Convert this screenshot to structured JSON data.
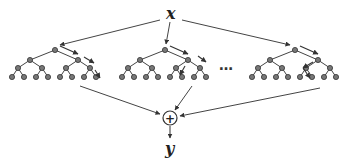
{
  "diagram": {
    "title": "",
    "input_label": "x",
    "output_label": "y",
    "aggregator_symbol": "+",
    "ellipsis": "…",
    "colors": {
      "line": "#444444",
      "node_fill": "#777777",
      "node_stroke": "#333333",
      "background": "#ffffff"
    },
    "trees": [
      {
        "id": "tree-1",
        "root_x": 55,
        "decision_path": [
          "right",
          "right",
          "right"
        ]
      },
      {
        "id": "tree-2",
        "root_x": 165,
        "decision_path": [
          "right",
          "left",
          "left"
        ]
      },
      {
        "id": "tree-3",
        "root_x": 295,
        "decision_path": [
          "right",
          "left",
          "right"
        ]
      }
    ]
  }
}
